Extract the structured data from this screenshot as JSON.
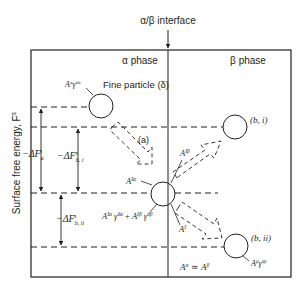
{
  "title": "α/β interface",
  "phases": {
    "alpha": "α phase",
    "beta": "β phase"
  },
  "axis": {
    "ylabel": "Surface free energy, F",
    "ylabel_sup": "s"
  },
  "particles": {
    "fine": {
      "label": "Fine particle (δ)",
      "energy_label": "A",
      "energy_sup": "α",
      "energy_gamma": "γ",
      "energy_gamma_sup": "δα"
    },
    "interface": {
      "label_ia": "A",
      "label_ia_sup": "Iα",
      "label_ib": "A",
      "label_ib_sup": "Iβ",
      "label_i": "A",
      "label_i_sup": "I",
      "energy_expr": "A^{Iα} γ^{δα} + A^{Iβ} γ^{δβ}"
    },
    "b_i": {
      "label": "(b, i)"
    },
    "b_ii": {
      "label": "(b, ii)",
      "energy_label": "A",
      "energy_sup": "β",
      "energy_gamma": "γ",
      "energy_gamma_sup": "δβ"
    }
  },
  "paths": {
    "a": "(a)"
  },
  "energy_differences": {
    "dFa": {
      "prefix": "−ΔF",
      "sub": "a",
      "sup": "s"
    },
    "dFbi": {
      "prefix": "−ΔF",
      "sub": "b, i",
      "sup": "s"
    },
    "dFbii": {
      "prefix": "−ΔF",
      "sub": "b, ii",
      "sup": "s"
    }
  },
  "relation": "A^α ≃ A^β",
  "colors": {
    "line": "#231f20",
    "background": "#ffffff"
  }
}
